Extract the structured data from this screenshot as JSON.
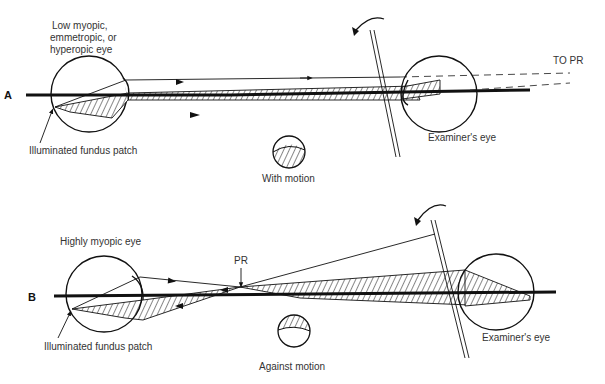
{
  "figure": {
    "panel_a": {
      "letter": "A",
      "subject_eye_label_lines": [
        "Low myopic,",
        "emmetropic, or",
        "hyperopic eye"
      ],
      "fundus_label": "Illuminated fundus patch",
      "examiner_label": "Examiner's eye",
      "far_point_label": "TO PR",
      "reflex_label": "With motion"
    },
    "panel_b": {
      "letter": "B",
      "subject_eye_label": "Highly myopic eye",
      "far_point_label": "PR",
      "fundus_label": "Illuminated fundus patch",
      "examiner_label": "Examiner's eye",
      "reflex_label": "Against motion"
    }
  }
}
